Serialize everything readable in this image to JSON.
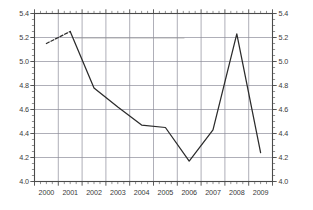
{
  "chart_data": {
    "type": "line",
    "title": "",
    "subtitle": "",
    "xlabel": "",
    "ylabel": "",
    "xlim": [
      2000.0,
      2010.0
    ],
    "ylim": [
      4.0,
      5.4
    ],
    "grid": true,
    "legend": false,
    "legend_position": "none",
    "y_ticks": [
      "5.4",
      "5.2",
      "5.0",
      "4.8",
      "4.6",
      "4.4",
      "4.2",
      "4.0"
    ],
    "y_tick_values": [
      5.4,
      5.2,
      5.0,
      4.8,
      4.6,
      4.4,
      4.2,
      4.0
    ],
    "y_axis_right_ticks": [
      "5.4",
      "5.2",
      "5.0",
      "4.8",
      "4.6",
      "4.4",
      "4.2",
      "4.0"
    ],
    "x_ticks": [
      "2000",
      "2001",
      "2002",
      "2003",
      "2004",
      "2005",
      "2006",
      "2007",
      "2008",
      "2009"
    ],
    "x_tick_values": [
      2000.5,
      2001.5,
      2002.5,
      2003.5,
      2004.5,
      2005.5,
      2006.5,
      2007.5,
      2008.5,
      2009.5
    ],
    "series": [
      {
        "name": "series-1",
        "color": "#2b2b2b",
        "x": [
          2000.5,
          2001.5,
          2002.5,
          2003.5,
          2004.5,
          2005.5,
          2006.5,
          2007.5,
          2008.5,
          2009.5
        ],
        "values": [
          5.15,
          5.25,
          4.78,
          4.62,
          4.47,
          4.45,
          4.17,
          4.43,
          5.23,
          4.24
        ],
        "dashed_segment_start": 2000.5,
        "dashed_segment_end": 2001.5
      }
    ],
    "artifact_line": {
      "name": "scan-artifact",
      "y": 5.195,
      "x_start": 2001.7,
      "x_end": 2006.3,
      "color": "#9a9a9a"
    },
    "colors": {
      "line": "#2b2b2b",
      "grid": "#8c8c99",
      "frame": "#4a4a4a",
      "tick_text": "#3a3a3a",
      "background": "#ffffff"
    }
  }
}
